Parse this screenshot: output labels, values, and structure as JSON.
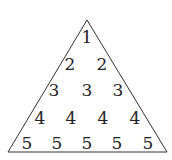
{
  "diagram": {
    "shape": "triangle",
    "stroke_color": "#333333",
    "text_color": "#222222",
    "rows": [
      [
        "1"
      ],
      [
        "2",
        "2"
      ],
      [
        "3",
        "3",
        "3"
      ],
      [
        "4",
        "4",
        "4",
        "4"
      ],
      [
        "5",
        "5",
        "5",
        "5",
        "5"
      ]
    ]
  }
}
